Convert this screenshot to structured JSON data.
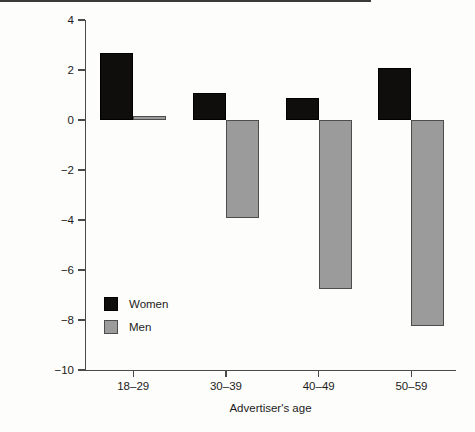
{
  "chart_data": {
    "type": "bar",
    "title": "",
    "subtitle": "",
    "xlabel": "Advertiser's age",
    "ylabel": "Preferred mean age difference",
    "categories": [
      "18–29",
      "30–39",
      "40–49",
      "50–59"
    ],
    "series": [
      {
        "name": "Women",
        "color": "#100d0d",
        "values": [
          2.7,
          1.1,
          0.9,
          2.1
        ]
      },
      {
        "name": "Men",
        "color": "#9b9b9b",
        "values": [
          0.15,
          -3.9,
          -6.75,
          -8.25
        ]
      }
    ],
    "ylim": [
      -10,
      4
    ],
    "yticks": [
      4,
      2,
      0,
      -2,
      -4,
      -6,
      -8,
      -10
    ],
    "ytick_labels": [
      "4",
      "2",
      "0",
      "−2",
      "−4",
      "−6",
      "−8",
      "−10"
    ],
    "grid": false,
    "zero_line": true,
    "legend_position": "lower-left-inside",
    "legend": [
      {
        "label": "Women",
        "swatch": "black-square"
      },
      {
        "label": "Men",
        "swatch": "gray-square"
      }
    ]
  },
  "colors": {
    "women": "#100d0d",
    "men": "#9b9b9b",
    "axis": "#4a4a4a",
    "background": "#fdfdfb"
  }
}
